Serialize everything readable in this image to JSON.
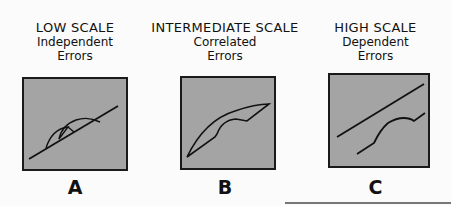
{
  "panels": [
    {
      "id": "A",
      "title": "LOW SCALE",
      "subtitle_line1": "Independent",
      "subtitle_line2": "Errors",
      "label": "A",
      "description": "Straight line with small separate arc (independent errors)"
    },
    {
      "id": "B",
      "title": "INTERMEDIATE SCALE",
      "subtitle_line1": "Correlated",
      "subtitle_line2": "Errors",
      "label": "B",
      "description": "Curved crescent shape (correlated errors)"
    },
    {
      "id": "C",
      "title": "HIGH SCALE",
      "subtitle_line1": "Dependent",
      "subtitle_line2": "Errors",
      "label": "C",
      "description": "Two separate parallel lines with offset bump (dependent errors)"
    }
  ],
  "colors": {
    "box_fill": "#a4a4a4",
    "box_border": "#1a1a1a",
    "line": "#111111",
    "background": "#fbfbfb"
  }
}
